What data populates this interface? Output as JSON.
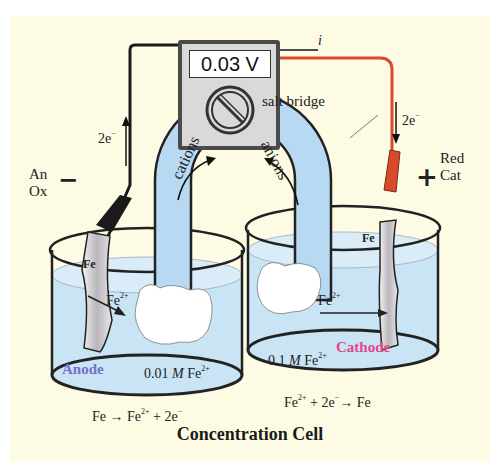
{
  "diagram": {
    "title": "Concentration Cell",
    "voltmeter": {
      "reading": "0.03 V"
    },
    "current_label": "i",
    "salt_bridge": {
      "label": "salt bridge",
      "left_flow": "cations",
      "right_flow": "anions"
    },
    "left_half_cell": {
      "electrode_label": "Fe",
      "ion_label": "Fe",
      "ion_charge": "2+",
      "role": "Anode",
      "role_color": "#7b6fc9",
      "sign": "−",
      "tag_line1": "An",
      "tag_line2": "Ox",
      "electron_label": "2e",
      "electron_charge": "−",
      "concentration_value": "0.01",
      "concentration_unit": "M",
      "concentration_species": "Fe",
      "concentration_charge": "2+",
      "reaction_lhs": "Fe → Fe",
      "reaction_charge": "2+",
      "reaction_rhs": " + 2e",
      "reaction_e_charge": "−"
    },
    "right_half_cell": {
      "electrode_label": "Fe",
      "ion_label": "Fe",
      "ion_charge": "2+",
      "role": "Cathode",
      "role_color": "#e0468a",
      "sign": "+",
      "tag_line1": "Red",
      "tag_line2": "Cat",
      "electron_label": "2e",
      "electron_charge": "−",
      "concentration_value": "0.1",
      "concentration_unit": "M",
      "concentration_species": "Fe",
      "concentration_charge": "2+",
      "reaction_lhs": "Fe",
      "reaction_charge": "2+",
      "reaction_mid": " + 2e",
      "reaction_e_charge": "−",
      "reaction_rhs": "→ Fe"
    },
    "colors": {
      "background": "#fdfbe3",
      "solution": "#c9e4f5",
      "bridge": "#b8d9f2",
      "red_wire": "#d84a2a",
      "black_wire": "#1a1a1a"
    }
  }
}
